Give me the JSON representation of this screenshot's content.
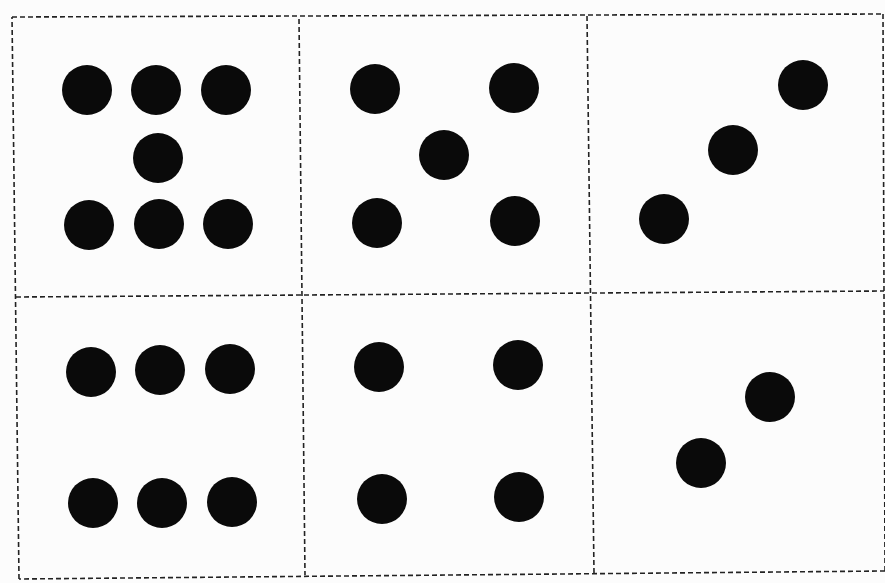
{
  "page": {
    "background": "#fcfcfc",
    "dot_color": "#0a0a0a",
    "line_color": "#222222",
    "dot_diameter": 50
  },
  "grid": {
    "outer": [
      [
        12,
        17
      ],
      [
        883,
        14
      ],
      [
        885,
        571
      ],
      [
        19,
        579
      ]
    ],
    "horizontal_divider": [
      [
        16,
        297
      ],
      [
        884,
        291
      ]
    ],
    "vertical_dividers": [
      [
        [
          299,
          19
        ],
        [
          305,
          575
        ]
      ],
      [
        [
          587,
          16
        ],
        [
          594,
          573
        ]
      ]
    ]
  },
  "cells": [
    {
      "name": "cell-top-left",
      "dot_count": 7,
      "dots": [
        [
          87,
          90
        ],
        [
          156,
          90
        ],
        [
          226,
          90
        ],
        [
          158,
          158
        ],
        [
          89,
          225
        ],
        [
          159,
          224
        ],
        [
          228,
          224
        ]
      ]
    },
    {
      "name": "cell-top-middle",
      "dot_count": 5,
      "dots": [
        [
          375,
          89
        ],
        [
          514,
          88
        ],
        [
          444,
          155
        ],
        [
          377,
          223
        ],
        [
          515,
          221
        ]
      ]
    },
    {
      "name": "cell-top-right",
      "dot_count": 3,
      "dots": [
        [
          803,
          85
        ],
        [
          733,
          150
        ],
        [
          664,
          219
        ]
      ]
    },
    {
      "name": "cell-bottom-left",
      "dot_count": 6,
      "dots": [
        [
          91,
          372
        ],
        [
          160,
          370
        ],
        [
          230,
          369
        ],
        [
          93,
          503
        ],
        [
          162,
          503
        ],
        [
          232,
          502
        ]
      ]
    },
    {
      "name": "cell-bottom-middle",
      "dot_count": 4,
      "dots": [
        [
          379,
          367
        ],
        [
          518,
          365
        ],
        [
          382,
          499
        ],
        [
          519,
          497
        ]
      ]
    },
    {
      "name": "cell-bottom-right",
      "dot_count": 2,
      "dots": [
        [
          770,
          397
        ],
        [
          701,
          463
        ]
      ]
    }
  ]
}
